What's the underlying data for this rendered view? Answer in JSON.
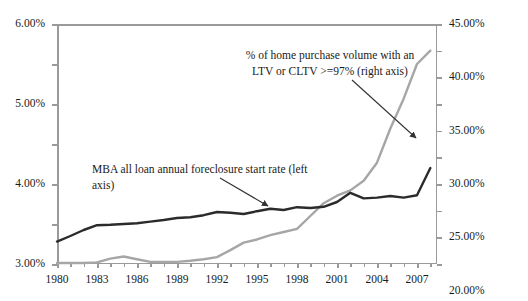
{
  "chart_data": {
    "type": "line",
    "title": "",
    "subtitle": "",
    "xlabel": "",
    "ylabel": "",
    "grid": false,
    "legend_position": "inline-annotations",
    "x": [
      1980,
      1981,
      1982,
      1983,
      1984,
      1985,
      1986,
      1987,
      1988,
      1989,
      1990,
      1991,
      1992,
      1993,
      1994,
      1995,
      1996,
      1997,
      1998,
      1999,
      2000,
      2001,
      2002,
      2003,
      2004,
      2005,
      2006,
      2007,
      2008
    ],
    "xlim": [
      1980,
      2008.5
    ],
    "xticks": [
      1980,
      1983,
      1986,
      1989,
      1992,
      1995,
      1998,
      2001,
      2004,
      2007
    ],
    "xtick_labels": [
      "1980",
      "1983",
      "1986",
      "1989",
      "1992",
      "1995",
      "1998",
      "2001",
      "2004",
      "2007"
    ],
    "left_axis": {
      "label": "",
      "ylim": [
        0.0,
        6.0
      ],
      "unit": "%",
      "ticks": [
        0.0,
        1.0,
        2.0,
        3.0,
        4.0,
        5.0,
        6.0
      ],
      "tick_labels": [
        "0.00%",
        "1.00%",
        "2.00%",
        "3.00%",
        "4.00%",
        "5.00%",
        "6.00%"
      ]
    },
    "right_axis": {
      "label": "",
      "ylim": [
        0.0,
        45.0
      ],
      "unit": "%",
      "ticks": [
        0.0,
        5.0,
        10.0,
        15.0,
        20.0,
        25.0,
        30.0,
        35.0,
        40.0,
        45.0
      ],
      "tick_labels": [
        "0.00%",
        "5.00%",
        "10.00%",
        "15.00%",
        "20.00%",
        "25.00%",
        "30.00%",
        "35.00%",
        "40.00%",
        "45.00%"
      ]
    },
    "series": [
      {
        "name": "MBA all loan annual foreclosure start rate (left axis)",
        "axis": "left",
        "color": "#2b2b2b",
        "values": [
          0.56,
          0.7,
          0.85,
          0.97,
          0.98,
          1.0,
          1.02,
          1.06,
          1.1,
          1.15,
          1.17,
          1.22,
          1.3,
          1.28,
          1.25,
          1.32,
          1.38,
          1.35,
          1.42,
          1.4,
          1.43,
          1.55,
          1.78,
          1.64,
          1.66,
          1.7,
          1.66,
          1.72,
          2.4
        ]
      },
      {
        "name": "% of home purchase volume with an LTV or CLTV >=97% (right axis)",
        "axis": "right",
        "color": "#a6a6a6",
        "values": [
          0.2,
          0.2,
          0.2,
          0.3,
          1.0,
          1.4,
          0.9,
          0.4,
          0.4,
          0.4,
          0.6,
          0.9,
          1.3,
          2.6,
          4.0,
          4.6,
          5.4,
          6.0,
          6.6,
          9.0,
          11.4,
          12.8,
          13.8,
          15.6,
          19.0,
          25.4,
          31.0,
          37.5,
          40.0
        ]
      }
    ],
    "annotations": [
      {
        "name": "ltv-series-annotation",
        "text": "% of home purchase volume with an\nLTV or CLTV >=97% (right axis)",
        "arrow": true
      },
      {
        "name": "mba-series-annotation",
        "text": "MBA all loan annual foreclosure start rate (left axis)",
        "arrow": true
      }
    ]
  }
}
